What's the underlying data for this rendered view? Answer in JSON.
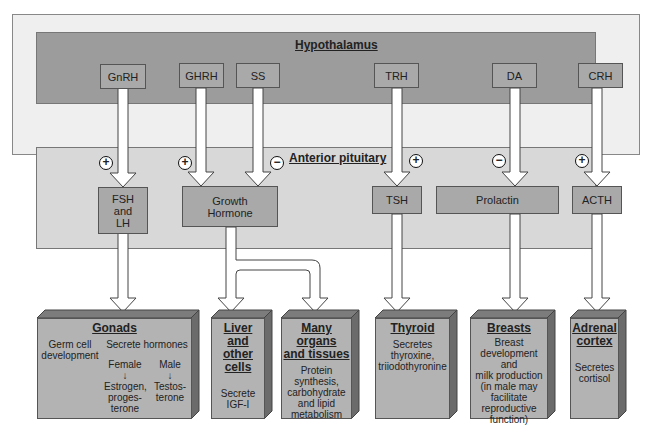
{
  "diagram": {
    "regions": {
      "hypothalamus": {
        "label": "Hypothalamus"
      },
      "anterior_pituitary": {
        "label": "Anterior pituitary"
      }
    },
    "hypothalamic_hormones": [
      {
        "id": "gnrh",
        "label": "GnRH"
      },
      {
        "id": "ghrh",
        "label": "GHRH"
      },
      {
        "id": "ss",
        "label": "SS"
      },
      {
        "id": "trh",
        "label": "TRH"
      },
      {
        "id": "da",
        "label": "DA"
      },
      {
        "id": "crh",
        "label": "CRH"
      }
    ],
    "effects": {
      "gnrh": "+",
      "ghrh": "+",
      "ss": "−",
      "trh": "+",
      "da": "−",
      "crh": "+"
    },
    "pituitary_hormones": [
      {
        "id": "fsh_lh",
        "label": "FSH\nand\nLH",
        "lines": [
          "FSH",
          "and",
          "LH"
        ]
      },
      {
        "id": "gh",
        "label": "Growth Hormone",
        "lines": [
          "Growth",
          "Hormone"
        ]
      },
      {
        "id": "tsh",
        "label": "TSH"
      },
      {
        "id": "prolactin",
        "label": "Prolactin"
      },
      {
        "id": "acth",
        "label": "ACTH"
      }
    ],
    "targets": {
      "gonads": {
        "title": "Gonads",
        "left": "Germ cell development",
        "left_lines": [
          "Germ cell",
          "development"
        ],
        "right_title": "Secrete hormones",
        "female": "Female",
        "male": "Male",
        "female_out_lines": [
          "Estrogen,",
          "proges-",
          "terone"
        ],
        "male_out_lines": [
          "Testos-",
          "terone"
        ]
      },
      "liver": {
        "title_lines": [
          "Liver and",
          "other cells"
        ],
        "body_lines": [
          "Secrete",
          "IGF-I"
        ]
      },
      "organs": {
        "title_lines": [
          "Many organs",
          "and tissues"
        ],
        "body_lines": [
          "Protein synthesis,",
          "carbohydrate",
          "and lipid",
          "metabolism"
        ]
      },
      "thyroid": {
        "title_lines": [
          "Thyroid"
        ],
        "body_lines": [
          "Secretes",
          "thyroxine,",
          "triiodothyronine"
        ]
      },
      "breasts": {
        "title_lines": [
          "Breasts"
        ],
        "body_lines": [
          "Breast",
          "development and",
          "milk production",
          "(in male may",
          "facilitate",
          "reproductive",
          "function)"
        ]
      },
      "adrenal": {
        "title_lines": [
          "Adrenal",
          "cortex"
        ],
        "body_lines": [
          "Secretes",
          "cortisol"
        ]
      }
    },
    "colors": {
      "hypothalamus_bg": "#9a9a9a",
      "pituitary_bg": "#d9d9d9",
      "box": "#a9a9a9",
      "organ": "#b3b3b3",
      "organ_top": "#7a7a7a",
      "organ_side": "#6a6a6a",
      "background": "#efefef"
    }
  }
}
